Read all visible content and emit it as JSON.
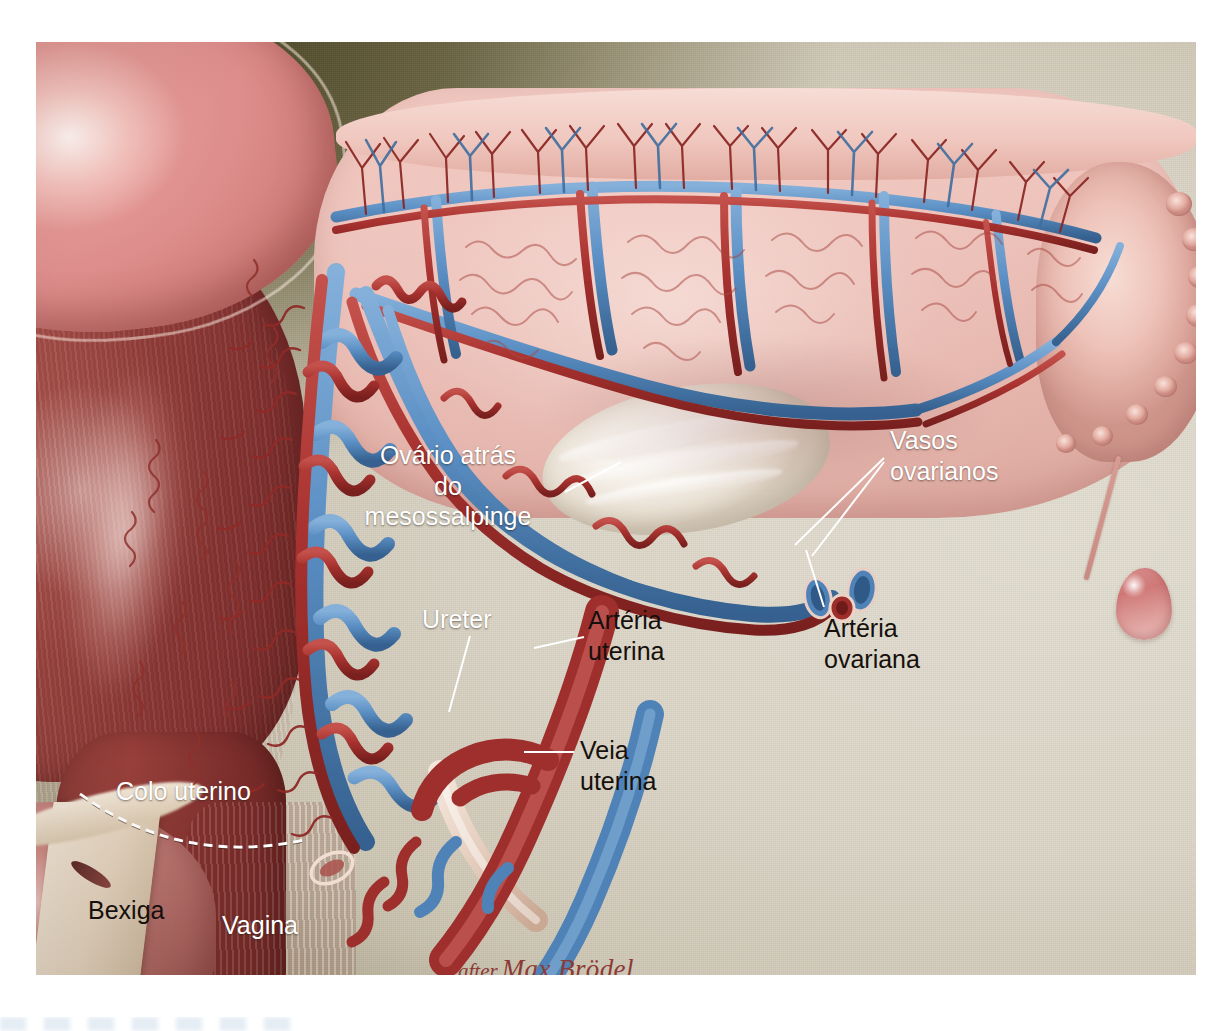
{
  "plate": {
    "subject": "Irrigação arterial e venosa do útero, tuba uterina e ovário",
    "style": "medical illustration",
    "background_color": "#d8d2c4",
    "credit": {
      "prefix": "after",
      "name": "Max Brödel",
      "color": "#8c3a36"
    }
  },
  "labels": [
    {
      "id": "ovario-atras-mesossalpinge",
      "text": "Ovário atrás\ndo\nmesossalpinge",
      "color": "#ffffff",
      "align": "center",
      "x": 420,
      "y": 440,
      "size": 25,
      "leader": {
        "from": [
          565,
          492
        ],
        "to": [
          621,
          462
        ]
      }
    },
    {
      "id": "vasos-ovarianos",
      "text": "Vasos\novarianos",
      "color": "#ffffff",
      "align": "left",
      "x": 890,
      "y": 425,
      "size": 25,
      "leader": {
        "from": [
          884,
          458
        ],
        "to": [
          795,
          545
        ]
      },
      "leader2": {
        "from": [
          884,
          462
        ],
        "to": [
          812,
          556
        ]
      }
    },
    {
      "id": "arteria-ovariana",
      "text": "Artéria\novariana",
      "color": "#15100c",
      "align": "left",
      "x": 824,
      "y": 613,
      "size": 25,
      "leader": {
        "from": [
          824,
          607
        ],
        "to": [
          789,
          548
        ]
      }
    },
    {
      "id": "ureter",
      "text": "Ureter",
      "color": "#ffffff",
      "align": "left",
      "x": 422,
      "y": 604,
      "size": 25,
      "leader": {
        "from": [
          470,
          636
        ],
        "to": [
          449,
          712
        ]
      }
    },
    {
      "id": "arteria-uterina",
      "text": "Artéria\nuterina",
      "color": "#15100c",
      "align": "left",
      "x": 588,
      "y": 605,
      "size": 25,
      "leader": {
        "from": [
          584,
          637
        ],
        "to": [
          534,
          648
        ]
      }
    },
    {
      "id": "veia-uterina",
      "text": "Veia\nuterina",
      "color": "#15100c",
      "align": "left",
      "x": 580,
      "y": 735,
      "size": 25,
      "leader": {
        "from": [
          574,
          752
        ],
        "to": [
          524,
          752
        ]
      }
    },
    {
      "id": "colo-uterino",
      "text": "Colo uterino",
      "color": "#ffffff",
      "align": "left",
      "x": 116,
      "y": 776,
      "size": 25,
      "bracket": "dashed-arc"
    },
    {
      "id": "bexiga",
      "text": "Bexiga",
      "color": "#15100c",
      "align": "left",
      "x": 88,
      "y": 895,
      "size": 25
    },
    {
      "id": "vagina",
      "text": "Vagina",
      "color": "#ffffff",
      "align": "left",
      "x": 222,
      "y": 910,
      "size": 25
    }
  ],
  "anatomy": {
    "structures": [
      "fundo do útero",
      "corpo do útero (miométrio)",
      "colo uterino",
      "vagina",
      "bexiga",
      "mesossalpinge / ligamento largo",
      "tuba uterina com fímbrias",
      "ovário",
      "hidátide de Morgagni",
      "ureter",
      "artéria uterina",
      "veia uterina",
      "artéria ovariana",
      "vasos ovarianos"
    ],
    "colors": {
      "artery": "#a8322f",
      "artery_dark": "#8a2522",
      "vein": "#5b8fc4",
      "vein_dark": "#3f6e9f",
      "ureter": "#e8d3c6",
      "serosa": "#f0c8c0",
      "myometrium": "#8e3b38",
      "fundus": "#dd8d8b",
      "ovary": "#f5f1e8"
    }
  }
}
